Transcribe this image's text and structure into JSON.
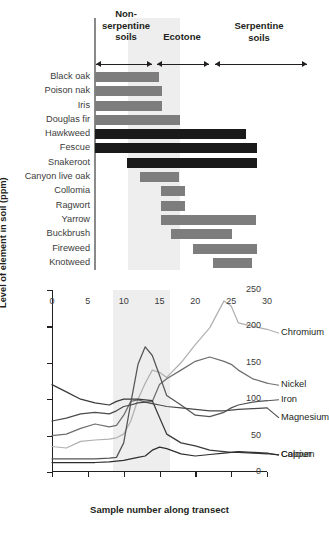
{
  "figure": {
    "zones": [
      {
        "id": "non-serpentine",
        "label": "Non-\nserpentine\nsoils"
      },
      {
        "id": "ecotone",
        "label": "Ecotone"
      },
      {
        "id": "serpentine",
        "label": "Serpentine\nsoils"
      }
    ],
    "zone_labels": {
      "non_serpentine": "Non-\nserpentine\nsoils",
      "ecotone": "Ecotone",
      "serpentine": "Serpentine\nsoils"
    },
    "colors": {
      "bar_gray": "#7d7d7d",
      "bar_dark": "#1a1a1a",
      "shading": "#ebebeb",
      "axis": "#231f20"
    },
    "species_chart": {
      "type": "bar",
      "note": "Horizontal range bars: species distribution across transect samples 0-30",
      "xlim": [
        0,
        30
      ],
      "species": [
        {
          "name": "Black oak",
          "start": 0,
          "end": 11.5,
          "shade": "gray"
        },
        {
          "name": "Poison nak",
          "start": 0,
          "end": 12.0,
          "shade": "gray"
        },
        {
          "name": "Iris",
          "start": 0,
          "end": 11.9,
          "shade": "gray"
        },
        {
          "name": "Douglas fir",
          "start": 0,
          "end": 15.2,
          "shade": "gray"
        },
        {
          "name": "Hawkweed",
          "start": 0,
          "end": 27.0,
          "shade": "dark"
        },
        {
          "name": "Fescue",
          "start": 0,
          "end": 29.0,
          "shade": "dark"
        },
        {
          "name": "Snakeroot",
          "start": 5.8,
          "end": 29.0,
          "shade": "dark"
        },
        {
          "name": "Canyon live oak",
          "start": 8.0,
          "end": 15.0,
          "shade": "gray"
        },
        {
          "name": "Collomia",
          "start": 11.8,
          "end": 16.0,
          "shade": "gray"
        },
        {
          "name": "Ragwort",
          "start": 11.8,
          "end": 16.0,
          "shade": "gray"
        },
        {
          "name": "Yarrow",
          "start": 11.8,
          "end": 28.8,
          "shade": "gray"
        },
        {
          "name": "Buckbrush",
          "start": 13.5,
          "end": 24.5,
          "shade": "gray"
        },
        {
          "name": "Fireweed",
          "start": 17.5,
          "end": 29.0,
          "shade": "gray"
        },
        {
          "name": "Knotweed",
          "start": 21.0,
          "end": 28.0,
          "shade": "gray"
        }
      ]
    },
    "chart_data": {
      "type": "line",
      "title": "",
      "xlabel": "Sample number along transect",
      "ylabel": "Level of element in soil (ppm)",
      "xlim": [
        0,
        30
      ],
      "ylim": [
        0,
        250
      ],
      "xticks": [
        0,
        5,
        10,
        15,
        20,
        25,
        30
      ],
      "yticks": [
        0,
        50,
        100,
        150,
        200,
        250
      ],
      "grid": false,
      "legend_position": "right-inline",
      "shaded_region": {
        "label": "Ecotone",
        "x_start": 8.5,
        "x_end": 16.5
      },
      "x": [
        0,
        2,
        4,
        6,
        8,
        9,
        10,
        11,
        12,
        13,
        14,
        15,
        16,
        18,
        20,
        22,
        24,
        25,
        26,
        28,
        30
      ],
      "series": [
        {
          "name": "Chromium",
          "color": "#b0b0b0",
          "values": [
            35,
            33,
            42,
            44,
            45,
            47,
            52,
            70,
            100,
            122,
            140,
            137,
            130,
            150,
            175,
            198,
            235,
            228,
            205,
            200,
            196
          ]
        },
        {
          "name": "Nickel",
          "color": "#6e6e6e",
          "values": [
            50,
            52,
            60,
            66,
            62,
            64,
            78,
            97,
            99,
            96,
            97,
            120,
            128,
            140,
            152,
            158,
            152,
            148,
            140,
            128,
            122
          ]
        },
        {
          "name": "Calcium",
          "color": "#3a3a3a",
          "values": [
            120,
            110,
            100,
            95,
            92,
            97,
            100,
            100,
            100,
            99,
            98,
            75,
            52,
            40,
            36,
            30,
            28,
            27,
            27,
            26,
            25
          ]
        },
        {
          "name": "Iron",
          "color": "#555555",
          "values": [
            18,
            18,
            18,
            18,
            19,
            20,
            40,
            95,
            148,
            172,
            160,
            133,
            105,
            92,
            78,
            76,
            82,
            88,
            92,
            96,
            98
          ]
        },
        {
          "name": "Magnesium",
          "color": "#4a4a4a",
          "values": [
            70,
            74,
            80,
            82,
            80,
            84,
            90,
            92,
            95,
            96,
            94,
            92,
            90,
            88,
            86,
            84,
            84,
            85,
            86,
            87,
            88
          ]
        },
        {
          "name": "Copper",
          "color": "#2e2e2e",
          "values": [
            13,
            13,
            13,
            13,
            14,
            15,
            16,
            18,
            20,
            22,
            30,
            34,
            32,
            25,
            22,
            24,
            26,
            27,
            28,
            27,
            26
          ]
        }
      ]
    }
  }
}
